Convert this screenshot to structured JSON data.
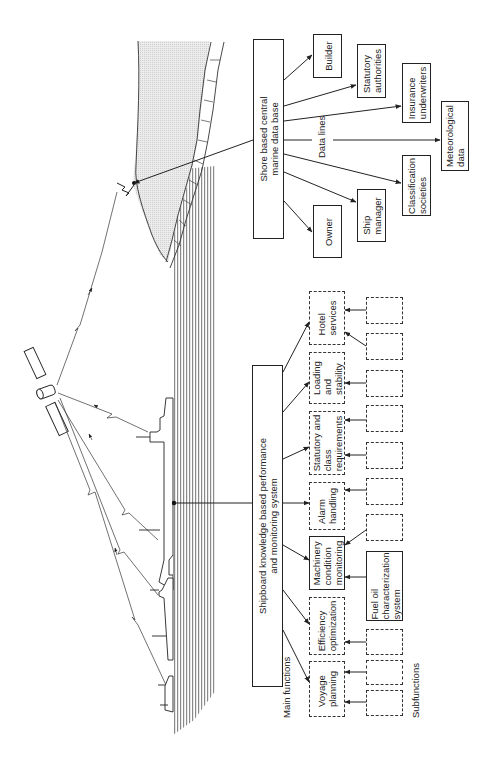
{
  "diagram": {
    "title": "",
    "shore": {
      "central_db": "Shore based central\nmarine data base",
      "data_lines_label": "Data lines",
      "recipients": [
        {
          "id": "builder",
          "label": "Builder"
        },
        {
          "id": "statutory",
          "label": "Statutory\nauthorities"
        },
        {
          "id": "insurance",
          "label": "Insurance\nunderwriters"
        },
        {
          "id": "meteo",
          "label": "Meteorological\ndata"
        },
        {
          "id": "classification",
          "label": "Classification\nsocieties"
        },
        {
          "id": "ship-manager",
          "label": "Ship\nmanager"
        },
        {
          "id": "owner",
          "label": "Owner"
        }
      ]
    },
    "shipboard": {
      "system": "Shipboard knowledge based performance\nand monitoring system",
      "main_functions_label": "Main functions",
      "subfunctions_label": "Subfunctions",
      "main_functions": [
        {
          "id": "hotel",
          "label": "Hotel\nservices",
          "style": "dashed"
        },
        {
          "id": "loading",
          "label": "Loading\nand\nstability",
          "style": "dashed"
        },
        {
          "id": "statutory-class",
          "label": "Statutory and\nclass\nrequirements",
          "style": "dashed"
        },
        {
          "id": "alarm",
          "label": "Alarm\nhandling",
          "style": "dashed"
        },
        {
          "id": "machinery",
          "label": "Machinery\ncondition\nmonitoring",
          "style": "solid"
        },
        {
          "id": "efficiency",
          "label": "Efficiency\noptimization",
          "style": "dashed"
        },
        {
          "id": "voyage",
          "label": "Voyage\nplanning",
          "style": "dashed"
        }
      ],
      "subfunctions": [
        {
          "label": "",
          "style": "dashed"
        },
        {
          "label": "",
          "style": "dashed"
        },
        {
          "label": "",
          "style": "dashed"
        },
        {
          "label": "",
          "style": "dashed"
        },
        {
          "label": "",
          "style": "dashed"
        },
        {
          "label": "",
          "style": "dashed"
        },
        {
          "label": "",
          "style": "dashed"
        },
        {
          "label": "Fuel oil\ncharacterization\nsystem",
          "style": "solid"
        },
        {
          "label": "",
          "style": "dashed"
        },
        {
          "label": "",
          "style": "dashed"
        },
        {
          "label": "",
          "style": "dashed"
        }
      ]
    },
    "illustration": {
      "elements": [
        "satellite",
        "shore-antenna",
        "coastline",
        "sea",
        "ship-1",
        "ship-2",
        "ship-3",
        "ship-4"
      ],
      "colors": {
        "line": "#222222",
        "land_fill": "#e6e6e6",
        "sea_hatch": "#7a7a7a",
        "background": "#ffffff"
      }
    }
  }
}
